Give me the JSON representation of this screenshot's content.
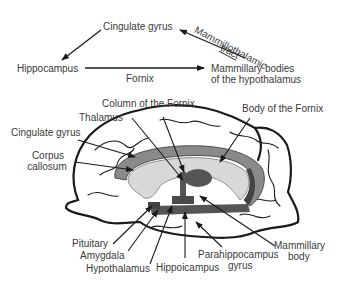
{
  "circuit": {
    "nodes": {
      "cingulate": "Cingulate gyrus",
      "hippocampus": "Hippocampus",
      "mammillary_line1": "Mammillary bodies",
      "mammillary_line2": "of the hypothalamus"
    },
    "edges": {
      "fornix": "Fornix",
      "mammillothalamic_line1": "Mammillothalamic",
      "mammillothalamic_line2": "tract"
    }
  },
  "brain": {
    "labels": {
      "column_fornix": "Column of the Fornix",
      "thalamus": "Thalamus",
      "body_fornix": "Body of the Fornix",
      "cingulate": "Cingulate gyrus",
      "corpus_line1": "Corpus",
      "corpus_line2": "callosum",
      "pituitary": "Pituitary",
      "amygdala": "Amygdala",
      "hypothalamus": "Hypothalamus",
      "hippocampus": "Hippoicampus",
      "parahippo_line1": "Parahippocampus",
      "parahippo_line2": "gyrus",
      "mammillary_line1": "Mammillary",
      "mammillary_line2": "body"
    },
    "colors": {
      "cingulate_fill": "#8a8a8a",
      "corpus_fill": "#d8d8d8",
      "fornix_fill": "#555555",
      "outline": "#1a1a1a"
    }
  }
}
